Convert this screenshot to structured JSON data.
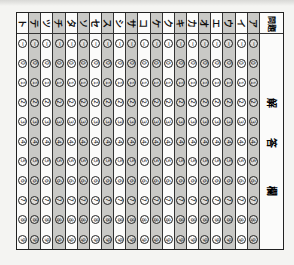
{
  "sheet": {
    "header": {
      "question_label": "問題",
      "answer_label": [
        "解",
        "答",
        "欄"
      ]
    },
    "columns": [
      "ト",
      "テ",
      "ツ",
      "チ",
      "タ",
      "ソ",
      "セ",
      "ス",
      "シ",
      "サ",
      "コ",
      "ケ",
      "ク",
      "キ",
      "カ",
      "オ",
      "エ",
      "ウ",
      "イ",
      "ア"
    ],
    "bubble_values": [
      "−",
      "0",
      "1",
      "2",
      "3",
      "4",
      "5",
      "6",
      "7",
      "8",
      "9"
    ],
    "colors": {
      "shade": "#c9c9c6",
      "line": "#222222",
      "paper": "#fbfbfa"
    }
  }
}
